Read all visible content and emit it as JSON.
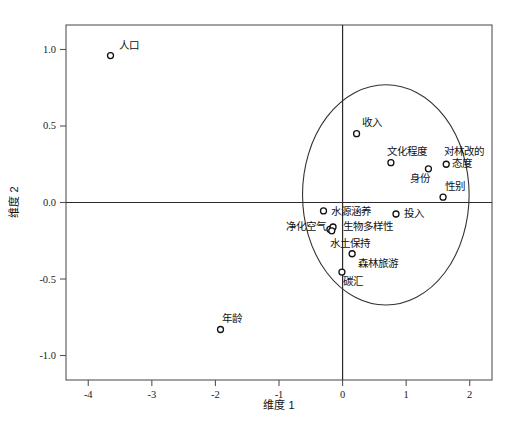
{
  "chart_data": {
    "type": "scatter",
    "title": "",
    "xlabel": "维度 1",
    "ylabel": "维度 2",
    "xlim": [
      -4.35,
      2.35
    ],
    "ylim": [
      -1.16,
      1.16
    ],
    "xticks": [
      "-4",
      "-3",
      "-2",
      "-1",
      "0",
      "1",
      "2"
    ],
    "xtick_values": [
      -4,
      -3,
      -2,
      -1,
      0,
      1,
      2
    ],
    "yticks": [
      "1.0",
      "0.5",
      "0.0",
      "-0.5",
      "-1.0"
    ],
    "ytick_values": [
      1.0,
      0.5,
      0.0,
      -0.5,
      -1.0
    ],
    "grid": false,
    "legend": "none",
    "origin_lines": true,
    "points": [
      {
        "label": "人口",
        "x": -3.65,
        "y": 0.96,
        "label_dx": 8,
        "label_dy": -7
      },
      {
        "label": "年龄",
        "x": -1.92,
        "y": -0.83,
        "label_dx": 1,
        "label_dy": -8
      },
      {
        "label": "收入",
        "x": 0.22,
        "y": 0.45,
        "label_dx": 5,
        "label_dy": -8
      },
      {
        "label": "文化程度",
        "x": 0.76,
        "y": 0.26,
        "label_dx": -4,
        "label_dy": -8
      },
      {
        "label": "身份",
        "x": 1.35,
        "y": 0.22,
        "label_dx": -18,
        "label_dy": 13
      },
      {
        "label": "对林改的",
        "x": 1.63,
        "y": 0.25,
        "label_dx": -2,
        "label_dy": -9
      },
      {
        "label": "态度",
        "x": 1.63,
        "y": 0.25,
        "label_dx": 6,
        "label_dy": 3,
        "no_marker": true
      },
      {
        "label": "性别",
        "x": 1.58,
        "y": 0.035,
        "label_dx": 2,
        "label_dy": -7
      },
      {
        "label": "水源涵养",
        "x": -0.3,
        "y": -0.055,
        "label_dx": 7,
        "label_dy": 4
      },
      {
        "label": "投入",
        "x": 0.84,
        "y": -0.075,
        "label_dx": 8,
        "label_dy": 3
      },
      {
        "label": "净化空气",
        "x": -0.2,
        "y": -0.175,
        "label_dx": -44,
        "label_dy": 1
      },
      {
        "label": "生物多样性",
        "x": -0.15,
        "y": -0.16,
        "label_dx": 10,
        "label_dy": 3
      },
      {
        "label": "水土保持",
        "x": -0.17,
        "y": -0.185,
        "label_dx": -2,
        "label_dy": 16
      },
      {
        "label": "森林旅游",
        "x": 0.15,
        "y": -0.335,
        "label_dx": 6,
        "label_dy": 13
      },
      {
        "label": "碳汇",
        "x": -0.01,
        "y": -0.455,
        "label_dx": 1,
        "label_dy": 13
      }
    ],
    "ellipse": {
      "center_x": 0.68,
      "center_y": 0.05,
      "radius_x": 1.31,
      "radius_y": 0.72
    }
  },
  "figure": {
    "caption": ""
  }
}
